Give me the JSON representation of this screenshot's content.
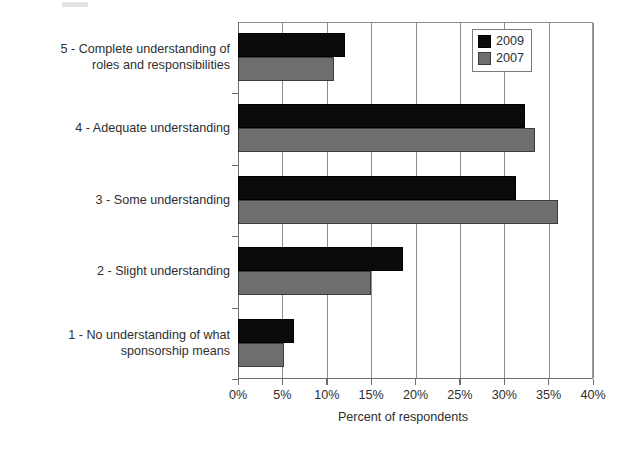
{
  "chart_data": {
    "type": "bar",
    "orientation": "horizontal",
    "title": "",
    "xlabel": "Percent of respondents",
    "ylabel": "",
    "xlim": [
      0,
      40
    ],
    "xtick_labels": [
      "0%",
      "5%",
      "10%",
      "15%",
      "20%",
      "25%",
      "30%",
      "35%",
      "40%"
    ],
    "xtick_values": [
      0,
      5,
      10,
      15,
      20,
      25,
      30,
      35,
      40
    ],
    "grid": true,
    "grid_axis": "x",
    "legend_position": "top-right",
    "categories": [
      "5 - Complete understanding of\nroles and responsibilities",
      "4 - Adequate understanding",
      "3 - Some understanding",
      "2 - Slight understanding",
      "1 - No understanding of what\nsponsorship means"
    ],
    "series": [
      {
        "name": "2009",
        "color": "#0b0b0b",
        "values": [
          12.0,
          32.3,
          31.3,
          18.6,
          6.3
        ]
      },
      {
        "name": "2007",
        "color": "#6e6e6e",
        "values": [
          10.8,
          33.5,
          36.0,
          15.0,
          5.2
        ]
      }
    ]
  },
  "legend": {
    "items": [
      {
        "label": "2009",
        "color": "#0b0b0b"
      },
      {
        "label": "2007",
        "color": "#6e6e6e"
      }
    ]
  },
  "axis": {
    "x_title": "Percent of respondents",
    "ticks": [
      "0%",
      "5%",
      "10%",
      "15%",
      "20%",
      "25%",
      "30%",
      "35%",
      "40%"
    ]
  },
  "categories": {
    "c5_line1": "5 - Complete understanding of",
    "c5_line2": "roles and responsibilities",
    "c4": "4 - Adequate understanding",
    "c3": "3 - Some understanding",
    "c2": "2 - Slight understanding",
    "c1_line1": "1 - No understanding of what",
    "c1_line2": "sponsorship means"
  },
  "colors": {
    "series_2009": "#0b0b0b",
    "series_2007": "#6e6e6e",
    "axis": "#6e6e6e",
    "grid": "#8d8d8d",
    "text": "#2e2e2e",
    "background": "#ffffff"
  }
}
